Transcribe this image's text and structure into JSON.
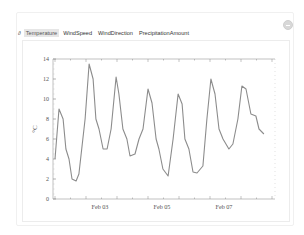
{
  "tabs": {
    "prefix": "∂",
    "items": [
      {
        "label": "Temperature",
        "active": true
      },
      {
        "label": "WindSpeed",
        "active": false
      },
      {
        "label": "WindDirection",
        "active": false
      },
      {
        "label": "PrecipitationAmount",
        "active": false
      }
    ]
  },
  "corner_icon": "minus-circle-icon",
  "colors": {
    "line": "#8c8c8c",
    "axis": "#555555",
    "tab_active_bg": "#e6e6e6"
  },
  "chart_data": {
    "type": "line",
    "title": "",
    "xlabel": "",
    "ylabel": "°C",
    "ylim": [
      0,
      14
    ],
    "yticks": [
      0,
      2,
      4,
      6,
      8,
      10,
      12,
      14
    ],
    "xtick_labels": [
      "Feb 03",
      "Feb 05",
      "Feb 07"
    ],
    "grid": false,
    "legend": null,
    "series": [
      {
        "name": "Temperature",
        "x_days": [
          0.0,
          0.13,
          0.26,
          0.35,
          0.45,
          0.55,
          0.68,
          0.77,
          0.97,
          1.1,
          1.23,
          1.32,
          1.42,
          1.55,
          1.68,
          1.81,
          1.97,
          2.06,
          2.19,
          2.32,
          2.42,
          2.58,
          2.71,
          2.84,
          3.0,
          3.13,
          3.26,
          3.35,
          3.48,
          3.65,
          3.81,
          3.97,
          4.1,
          4.19,
          4.32,
          4.45,
          4.58,
          4.77,
          4.9,
          5.03,
          5.16,
          5.29,
          5.42,
          5.61,
          5.74,
          5.9,
          6.03,
          6.16,
          6.32,
          6.48,
          6.58,
          6.74
        ],
        "values": [
          4.0,
          9.0,
          8.0,
          5.0,
          4.0,
          2.0,
          1.8,
          2.5,
          8.0,
          13.5,
          12.0,
          8.0,
          7.0,
          5.0,
          5.0,
          7.0,
          12.2,
          10.5,
          7.0,
          6.0,
          4.3,
          4.5,
          6.0,
          7.0,
          11.0,
          9.6,
          6.0,
          5.0,
          3.0,
          2.3,
          6.0,
          10.5,
          9.5,
          6.0,
          5.0,
          2.7,
          2.6,
          3.3,
          8.0,
          12.0,
          10.5,
          7.0,
          6.0,
          5.0,
          5.5,
          8.0,
          11.3,
          11.0,
          8.5,
          8.3,
          7.0,
          6.5
        ]
      }
    ]
  }
}
